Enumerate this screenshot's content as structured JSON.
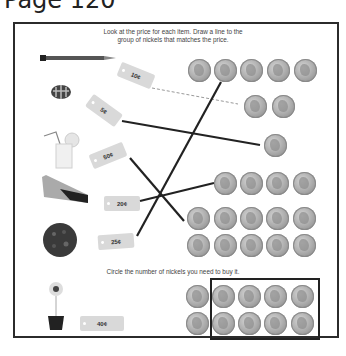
{
  "page": {
    "title": "Page 120"
  },
  "section1": {
    "instruction_line1": "Look at the price for each item. Draw a line to the",
    "instruction_line2": "group of nickels that matches the price.",
    "items": [
      {
        "name": "pencil",
        "icon": "pencil-icon",
        "price": "10¢"
      },
      {
        "name": "candy",
        "icon": "candy-icon",
        "price": "5¢"
      },
      {
        "name": "lemonade",
        "icon": "lemonade-icon",
        "price": "50¢"
      },
      {
        "name": "eraser",
        "icon": "eraser-icon",
        "price": "20¢"
      },
      {
        "name": "cookie",
        "icon": "cookie-icon",
        "price": "25¢"
      }
    ],
    "nickel_groups": [
      {
        "count": 5
      },
      {
        "count": 2
      },
      {
        "count": 1
      },
      {
        "count": 4
      },
      {
        "count": 10
      }
    ],
    "matches": [
      {
        "price": "10¢",
        "nickels": 2,
        "style": "dashed"
      },
      {
        "price": "5¢",
        "nickels": 1,
        "style": "solid"
      },
      {
        "price": "50¢",
        "nickels": 10,
        "style": "solid"
      },
      {
        "price": "20¢",
        "nickels": 4,
        "style": "solid"
      },
      {
        "price": "25¢",
        "nickels": 5,
        "style": "solid"
      }
    ]
  },
  "section2": {
    "instruction": "Circle the number of nickels you need to buy it.",
    "item": {
      "name": "flower",
      "icon": "flower-pot-icon",
      "price": "40¢"
    },
    "nickels_shown": 10,
    "nickels_circled": 8
  },
  "colors": {
    "line": "#222222",
    "tag": "#d9d9d9",
    "border": "#2b2b2b",
    "coin": "#a9a9a9"
  }
}
